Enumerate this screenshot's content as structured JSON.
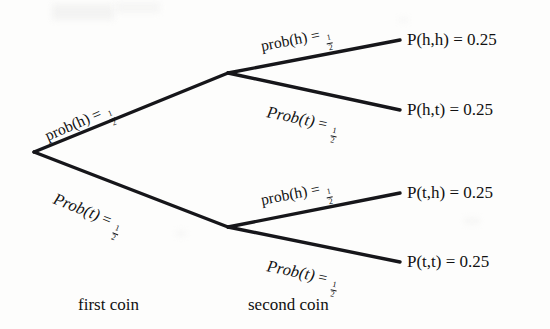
{
  "diagram": {
    "type": "probability-tree",
    "stages": [
      {
        "caption": "first coin"
      },
      {
        "caption": "second coin"
      }
    ],
    "branches": {
      "first_heads": {
        "fn": "prob(h)",
        "eq": "=",
        "num": "1",
        "den": "2"
      },
      "first_tails": {
        "fn": "Prob(t)",
        "eq": "=",
        "num": "1",
        "den": "2"
      },
      "second_heads_from_heads": {
        "fn": "prob(h)",
        "eq": "=",
        "num": "1",
        "den": "2"
      },
      "second_tails_from_heads": {
        "fn": "Prob(t)",
        "eq": "=",
        "num": "1",
        "den": "2"
      },
      "second_heads_from_tails": {
        "fn": "prob(h)",
        "eq": "=",
        "num": "1",
        "den": "2"
      },
      "second_tails_from_tails": {
        "fn": "Prob(t)",
        "eq": "=",
        "num": "1",
        "den": "2"
      }
    },
    "outcomes": [
      {
        "label": "P(h,h) = 0.25",
        "path": "h,h",
        "probability": 0.25
      },
      {
        "label": "P(h,t) = 0.25",
        "path": "h,t",
        "probability": 0.25
      },
      {
        "label": "P(t,h) = 0.25",
        "path": "t,h",
        "probability": 0.25
      },
      {
        "label": "P(t,t) = 0.25",
        "path": "t,t",
        "probability": 0.25
      }
    ],
    "colors": {
      "ink": "#16161a",
      "paper": "#fdfdfc"
    }
  }
}
